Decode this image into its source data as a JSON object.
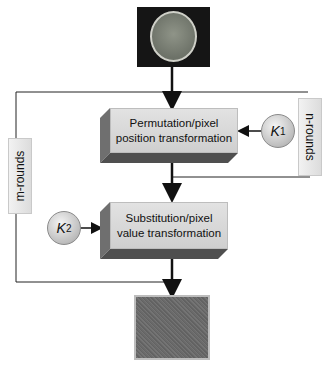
{
  "diagram": {
    "input_image": {
      "label": "brain MRI input image"
    },
    "output_image": {
      "label": "encrypted noise output image"
    },
    "permutation_block": {
      "line1": "Permutation/pixel",
      "line2": "position transformation"
    },
    "substitution_block": {
      "line1": "Substitution/pixel",
      "line2": "value transformation"
    },
    "key1": {
      "symbol": "K",
      "subscript": "1"
    },
    "key2": {
      "symbol": "K",
      "subscript": "2"
    },
    "n_rounds_label": "n-rounds",
    "m_rounds_label": "m-rounds",
    "colors": {
      "block": "#d6d6d6",
      "block_side": "#7a7a7a",
      "line": "#222222",
      "output": "#6a6a6a"
    }
  }
}
